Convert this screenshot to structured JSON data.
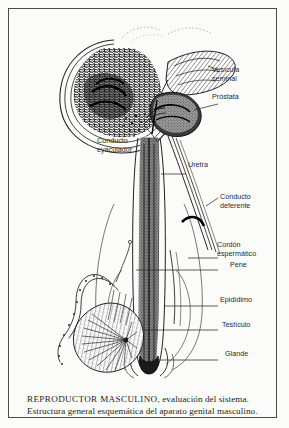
{
  "plate": {
    "title": "REPRODUCTOR MASCULINO",
    "caption_lead": "REPRODUCTOR MASCULINO",
    "caption_rest": ", evaluación del sistema. Estructura general esquemática del aparato genital masculino.",
    "caption_full": "REPRODUCTOR MASCULINO, evaluación del sistema. Estructura general esquemática del aparato genital masculino.",
    "ink_color": "#1c1c1c",
    "paper_color": "#fbfbf9",
    "border_color": "#4a4a4a"
  },
  "labels": {
    "vesicula_seminal": "Vesícula\nseminal",
    "prostata": "Próstata",
    "conducto_eyaculador": "Conducto\neyaculador",
    "uretra": "Uretra",
    "conducto_deferente": "Conducto\ndeferente",
    "cordon_espermatico": "Cordón\nespermático",
    "pene": "Pene",
    "epididimo": "Epidídimo",
    "testiculo": "Testículo",
    "glande": "Glande"
  },
  "figure": {
    "type": "anatomical-line-drawing",
    "structures": [
      "bladder",
      "seminal vesicle",
      "prostate",
      "ejaculatory duct",
      "urethra",
      "vas deferens",
      "spermatic cord",
      "penis shaft",
      "epididymis",
      "testis",
      "glans"
    ]
  }
}
